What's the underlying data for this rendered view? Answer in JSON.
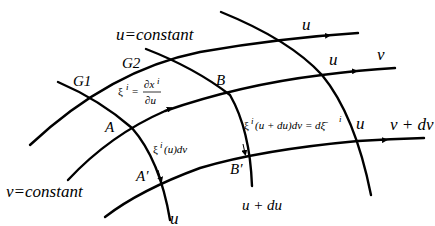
{
  "diagram": {
    "labels": {
      "u_constant": "u=constant",
      "v_constant": "v=constant",
      "g1": "G1",
      "g2": "G2",
      "point_a": "A",
      "point_b": "B",
      "point_a_prime": "A′",
      "point_b_prime": "B′",
      "u_top": "u",
      "u_mid": "u",
      "u_right": "u",
      "u_bottom": "u",
      "v": "v",
      "v_plus_dv": "v + dv",
      "u_plus_du": "u + du"
    },
    "equations": {
      "xi_def_lhs": "ξ",
      "xi_def_sup": "i",
      "xi_def_eq": "=",
      "xi_def_num": "∂x",
      "xi_def_num_sup": "i",
      "xi_def_den": "∂u",
      "xi_u_dv": "ξ",
      "xi_u_dv_sup": "i",
      "xi_u_dv_rest": "(u)dv",
      "xi_udu_dv": "ξ",
      "xi_udu_dv_sup": "i",
      "xi_udu_dv_rest": "(u + du)dv = dξ̄",
      "xi_udu_dv_sup2": "i"
    },
    "colors": {
      "stroke": "#000000",
      "background": "#ffffff"
    }
  }
}
